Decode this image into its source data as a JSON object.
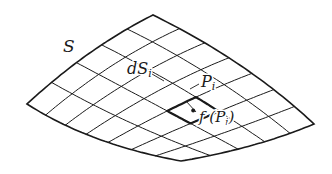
{
  "figure": {
    "type": "surface-element-diagram",
    "labels": {
      "surface": "S",
      "element": "dS",
      "element_sub": "i",
      "point": "P",
      "point_sub": "i",
      "function_prefix": "f (P",
      "function_sub": "i",
      "function_suffix": ")"
    },
    "colors": {
      "line": "#1a1a1a",
      "background": "#ffffff"
    },
    "grid": {
      "u_divisions": 7,
      "v_divisions": 5,
      "highlight_cell": {
        "u": 4,
        "v": 2
      }
    },
    "corners": {
      "top": [
        153,
        15
      ],
      "right": [
        314,
        124
      ],
      "bottom": [
        181,
        161
      ],
      "left": [
        27,
        104
      ]
    }
  }
}
